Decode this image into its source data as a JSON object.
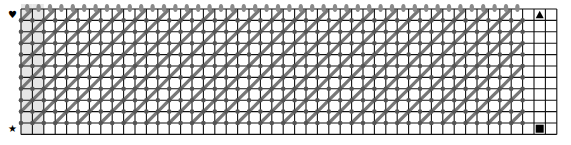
{
  "grid": {
    "columns": 47,
    "rows": 11,
    "origin_x": 21,
    "origin_y": 9,
    "cell": 11.4,
    "line_color": "#111111",
    "shaded_columns": [
      0,
      1
    ],
    "shade_color": "#e6e6e6",
    "pattern_columns": 44,
    "diagonal_color": "#777777",
    "pin_color": "#555555",
    "bobbin_color": "#8a8a8a"
  },
  "markers": {
    "top_left": {
      "glyph": "♥",
      "name": "heart-marker"
    },
    "bottom_left": {
      "glyph": "★",
      "name": "star-marker"
    },
    "top_right": {
      "glyph": "▲",
      "name": "triangle-marker"
    },
    "bottom_right": {
      "glyph": "■",
      "name": "square-marker"
    }
  }
}
